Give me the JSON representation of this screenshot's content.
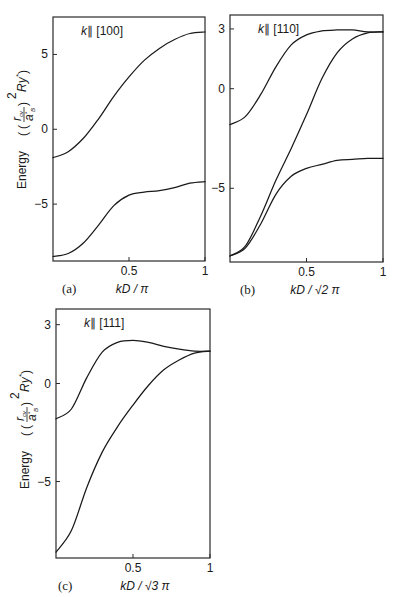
{
  "figure": {
    "y_axis_label": "Energy ((r_cv / a_B*)^2 Ry*)",
    "y_axis_word": "Energy"
  },
  "chart_data": [
    {
      "type": "line",
      "panel": "(a)",
      "title": "k∥ [100]",
      "xlabel": "kD / π",
      "ylabel": "Energy ((r_cv/a_B*)^2 Ry*)",
      "xlim": [
        0,
        1
      ],
      "ylim": [
        -8.8,
        7.5
      ],
      "xticks": [
        "0.5",
        "1"
      ],
      "yticks": [
        "5",
        "0",
        "−5"
      ],
      "grid": false,
      "x": [
        0,
        0.1,
        0.2,
        0.3,
        0.4,
        0.5,
        0.6,
        0.7,
        0.8,
        0.9,
        1.0
      ],
      "series": [
        {
          "name": "upper band",
          "values": [
            -1.9,
            -1.5,
            -0.6,
            0.7,
            2.2,
            3.5,
            4.6,
            5.4,
            6.0,
            6.4,
            6.5
          ]
        },
        {
          "name": "lower band",
          "values": [
            -8.5,
            -8.3,
            -7.6,
            -6.4,
            -5.1,
            -4.4,
            -4.2,
            -4.1,
            -3.9,
            -3.6,
            -3.5
          ]
        }
      ]
    },
    {
      "type": "line",
      "panel": "(b)",
      "title": "k∥ [110]",
      "xlabel": "kD / √2 π",
      "ylabel": "",
      "xlim": [
        0,
        1
      ],
      "ylim": [
        -8.7,
        3.7
      ],
      "xticks": [
        "0.5",
        "1"
      ],
      "yticks": [
        "3",
        "0",
        "−5"
      ],
      "grid": false,
      "x": [
        0,
        0.1,
        0.2,
        0.3,
        0.4,
        0.5,
        0.6,
        0.7,
        0.8,
        0.9,
        1.0
      ],
      "series": [
        {
          "name": "upper band",
          "values": [
            -1.8,
            -1.4,
            -0.3,
            1.1,
            2.2,
            2.7,
            2.9,
            2.95,
            2.95,
            2.85,
            2.85
          ]
        },
        {
          "name": "middle band",
          "values": [
            -8.4,
            -7.9,
            -6.4,
            -4.6,
            -3.0,
            -1.3,
            0.5,
            1.8,
            2.5,
            2.8,
            2.85
          ]
        },
        {
          "name": "lower band",
          "values": [
            -8.4,
            -8.0,
            -6.8,
            -5.3,
            -4.4,
            -4.0,
            -3.8,
            -3.6,
            -3.55,
            -3.5,
            -3.5
          ]
        }
      ]
    },
    {
      "type": "line",
      "panel": "(c)",
      "title": "k∥ [111]",
      "xlabel": "kD / √3 π",
      "ylabel": "Energy ((r_cv/a_B*)^2 Ry*)",
      "xlim": [
        0,
        1
      ],
      "ylim": [
        -8.9,
        3.8
      ],
      "xticks": [
        "0.5",
        "1"
      ],
      "yticks": [
        "3",
        "0",
        "−5"
      ],
      "grid": false,
      "x": [
        0,
        0.1,
        0.2,
        0.3,
        0.4,
        0.5,
        0.6,
        0.7,
        0.8,
        0.9,
        1.0
      ],
      "series": [
        {
          "name": "upper band",
          "values": [
            -1.8,
            -1.3,
            0.3,
            1.6,
            2.1,
            2.2,
            2.1,
            1.9,
            1.75,
            1.65,
            1.65
          ]
        },
        {
          "name": "lower band",
          "values": [
            -8.6,
            -7.5,
            -5.3,
            -3.5,
            -2.2,
            -1.1,
            -0.1,
            0.7,
            1.2,
            1.55,
            1.65
          ]
        }
      ]
    }
  ]
}
